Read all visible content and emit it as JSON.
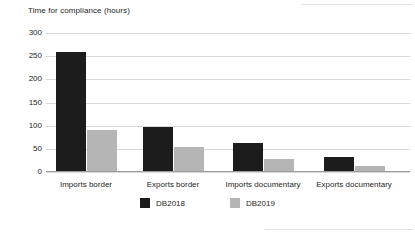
{
  "chart_data": {
    "type": "bar",
    "title": "Time for compliance (hours)",
    "categories": [
      "Imports border",
      "Exports border",
      "Imports documentary",
      "Exports documentary"
    ],
    "series": [
      {
        "name": "DB2018",
        "color": "#1c1c1c",
        "values": [
          258,
          98,
          62,
          33
        ]
      },
      {
        "name": "DB2019",
        "color": "#b5b5b5",
        "values": [
          90,
          54,
          28,
          14
        ]
      }
    ],
    "xlabel": "",
    "ylabel": "",
    "ylim": [
      0,
      300
    ],
    "yticks": [
      300,
      250,
      200,
      150,
      100,
      50,
      0
    ],
    "grid": true,
    "gridline_color": "#d9d9d9",
    "baseline_color": "#9c9c9c",
    "legend_position": "bottom-center",
    "background": "#ffffff"
  }
}
